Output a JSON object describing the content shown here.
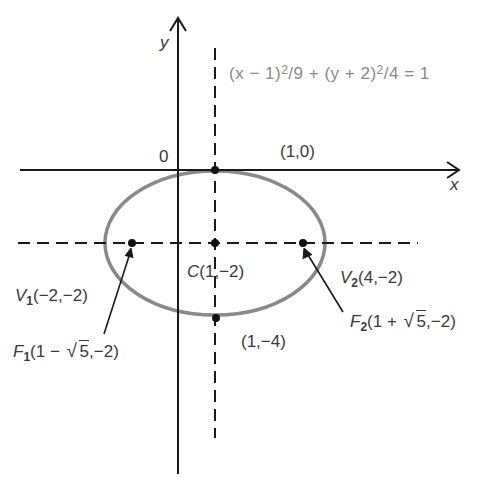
{
  "diagram": {
    "type": "ellipse-graph",
    "equation": {
      "text": "(x − 1)²/9 + (y + 2)²/4 = 1",
      "part1": "(x − 1)",
      "exp1": "2",
      "part2": "/9 + (y + 2)",
      "exp2": "2",
      "part3": "/4 = 1"
    },
    "axes": {
      "x_label": "x",
      "y_label": "y",
      "origin_label": "0"
    },
    "ellipse": {
      "center": [
        1,
        -2
      ],
      "a": 3,
      "b": 2,
      "stroke_color": "#8a8a8a"
    },
    "points": {
      "top": {
        "label": "(1,0)",
        "coords": [
          1,
          0
        ]
      },
      "center": {
        "prefix": "C",
        "label": "(1,−2)",
        "coords": [
          1,
          -2
        ]
      },
      "bottom": {
        "label": "(1,−4)",
        "coords": [
          1,
          -4
        ]
      },
      "v1": {
        "prefix": "V",
        "sub": "1",
        "label": "(−2,−2)",
        "coords": [
          -2,
          -2
        ]
      },
      "v2": {
        "prefix": "V",
        "sub": "2",
        "label": "(4,−2)",
        "coords": [
          4,
          -2
        ]
      },
      "f1": {
        "prefix": "F",
        "sub": "1",
        "pre": "(1 − ",
        "radicand": "5",
        "post": ",−2)",
        "coords": [
          "1-√5",
          -2
        ]
      },
      "f2": {
        "prefix": "F",
        "sub": "2",
        "pre": "(1 + ",
        "radicand": "5",
        "post": ",−2)",
        "coords": [
          "1+√5",
          -2
        ]
      }
    },
    "colors": {
      "axis": "#1a1a1a",
      "ellipse": "#8a8a8a",
      "text": "#3a3a3a",
      "equation_text": "#8a8a8a"
    }
  }
}
